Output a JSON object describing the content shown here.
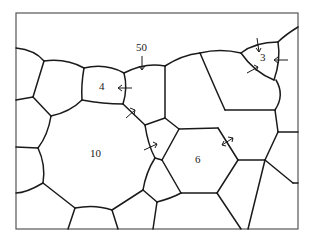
{
  "figure": {
    "labels": [
      {
        "id": "grain-4",
        "text": "4",
        "x": 101,
        "y": 81
      },
      {
        "id": "migration-50",
        "text": "50",
        "x": 137,
        "y": 42
      },
      {
        "id": "grain-3",
        "text": "3",
        "x": 259,
        "y": 52
      },
      {
        "id": "grain-10",
        "text": "10",
        "x": 90,
        "y": 148
      },
      {
        "id": "grain-6",
        "text": "6",
        "x": 195,
        "y": 155
      }
    ],
    "colors": {
      "boundary": "#1a1a1a",
      "frame": "#555555",
      "background": "#ffffff"
    }
  }
}
